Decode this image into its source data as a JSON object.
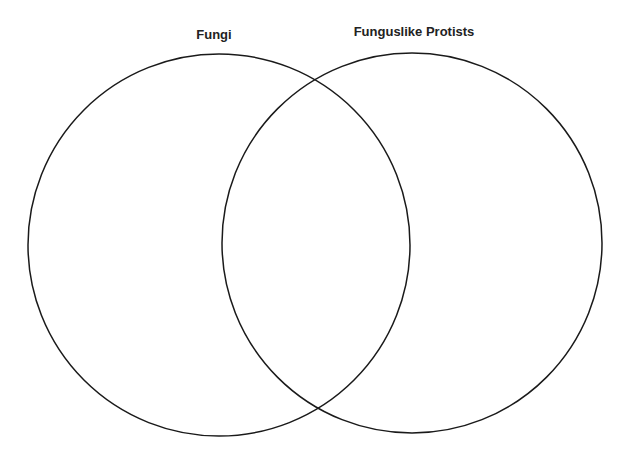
{
  "diagram": {
    "type": "venn",
    "sets": [
      {
        "label": "Fungi",
        "cx": 219,
        "cy": 245,
        "r": 191
      },
      {
        "label": "Funguslike Protists",
        "cx": 412,
        "cy": 243,
        "r": 191
      }
    ],
    "stroke_color": "#1a1a1a",
    "background": "#ffffff"
  }
}
